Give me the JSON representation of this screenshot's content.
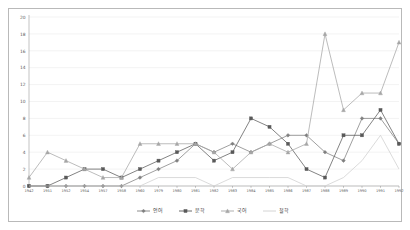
{
  "chart_data": {
    "type": "line",
    "title": "",
    "subtitle": "",
    "xlabel": "",
    "ylabel": "",
    "ylim": [
      0,
      20
    ],
    "ytick_step": 2,
    "grid": true,
    "legend_position": "bottom",
    "yticks": [
      "0",
      "2",
      "4",
      "6",
      "8",
      "10",
      "12",
      "14",
      "16",
      "18",
      "20"
    ],
    "categories": [
      "1942",
      "1951",
      "1952",
      "1954",
      "1957",
      "1958",
      "1960",
      "1979",
      "1980",
      "1981",
      "1982",
      "1983",
      "1984",
      "1985",
      "1986",
      "1987",
      "1988",
      "1989",
      "1990",
      "1991",
      "1992"
    ],
    "series": [
      {
        "name": "언어",
        "color": "#7f7f7f",
        "marker": "diamond",
        "values": [
          0,
          0,
          0,
          0,
          0,
          0,
          1,
          2,
          3,
          5,
          4,
          5,
          4,
          5,
          6,
          6,
          4,
          3,
          8,
          8,
          5
        ]
      },
      {
        "name": "문학",
        "color": "#595959",
        "marker": "square",
        "values": [
          0,
          0,
          1,
          2,
          2,
          1,
          2,
          3,
          4,
          5,
          3,
          4,
          8,
          7,
          5,
          2,
          1,
          6,
          6,
          9,
          5
        ]
      },
      {
        "name": "국어",
        "color": "#a6a6a6",
        "marker": "triangle",
        "values": [
          1,
          4,
          3,
          2,
          1,
          1,
          5,
          5,
          5,
          5,
          4,
          2,
          4,
          5,
          4,
          5,
          18,
          9,
          11,
          11,
          17
        ]
      },
      {
        "name": "철학",
        "color": "#cfcfcf",
        "marker": "none",
        "values": [
          0,
          0,
          0,
          0,
          0,
          0,
          0,
          1,
          1,
          1,
          0,
          1,
          1,
          1,
          1,
          0,
          0,
          1,
          3,
          6,
          2
        ]
      }
    ]
  }
}
